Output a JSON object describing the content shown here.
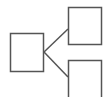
{
  "diagram": {
    "type": "tree-branch",
    "stroke_color": "#555555",
    "background": "#ffffff",
    "nodes": [
      {
        "id": "root",
        "label": "",
        "x": 10,
        "y": 33,
        "w": 34,
        "h": 39
      },
      {
        "id": "child-top",
        "label": "",
        "x": 68,
        "y": 7,
        "w": 34,
        "h": 38
      },
      {
        "id": "child-bottom",
        "label": "",
        "x": 68,
        "y": 60,
        "w": 34,
        "h": 40
      }
    ],
    "edges": [
      {
        "from": "root",
        "to": "child-top"
      },
      {
        "from": "root",
        "to": "child-bottom"
      }
    ]
  }
}
